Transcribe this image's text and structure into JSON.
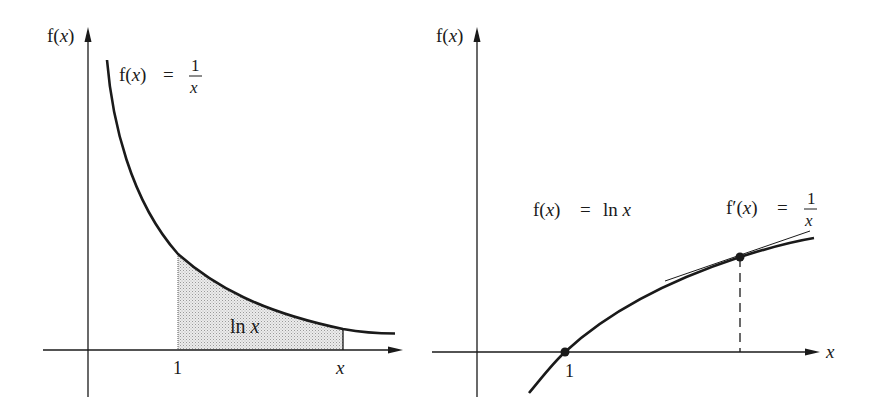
{
  "colors": {
    "ink": "#1a1a1a",
    "shade": "#d9d9d9",
    "background": "#ffffff"
  },
  "left_panel": {
    "y_axis_label_prefix": "f(",
    "y_axis_label_var": "x",
    "y_axis_label_suffix": ")",
    "curve_label": {
      "lhs_prefix": "f(",
      "lhs_var": "x",
      "lhs_suffix": ")",
      "equals": "=",
      "numerator": "1",
      "denominator": "x"
    },
    "area_label_fn": "ln",
    "area_label_var": "x",
    "x_tick_1": "1",
    "x_tick_x": "x"
  },
  "right_panel": {
    "y_axis_label_prefix": "f(",
    "y_axis_label_var": "x",
    "y_axis_label_suffix": ")",
    "x_axis_label": "x",
    "curve_label": {
      "lhs_prefix": "f(",
      "lhs_var": "x",
      "lhs_suffix": ")",
      "equals": "=",
      "rhs_fn": "ln",
      "rhs_var": "x"
    },
    "derivative_label": {
      "lhs_prefix": "f′(",
      "lhs_var": "x",
      "lhs_suffix": ")",
      "equals": "=",
      "numerator": "1",
      "denominator": "x"
    },
    "x_tick_1": "1"
  }
}
